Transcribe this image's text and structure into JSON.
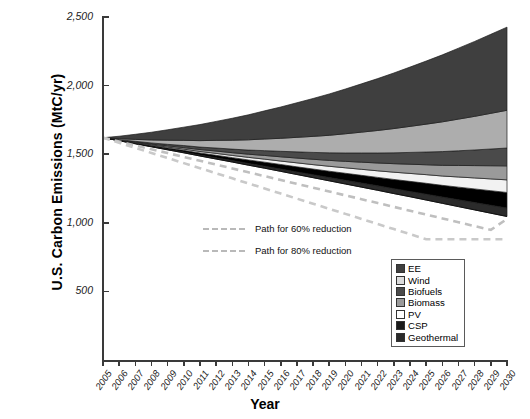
{
  "chart_data": {
    "type": "area",
    "title": "",
    "xlabel": "Year",
    "ylabel": "U.S. Carbon Emissions (MtC/yr)",
    "xlim": [
      2005,
      2030
    ],
    "ylim": [
      0,
      2500
    ],
    "ytick_labels": [
      "2,500",
      "2,000",
      "1,500",
      "1,000",
      "500"
    ],
    "ytick_values": [
      2500,
      2000,
      1500,
      1000,
      500
    ],
    "ytick_interval": 500,
    "grid": false,
    "legend_position": "inside-lower-right",
    "x": [
      2005,
      2006,
      2007,
      2008,
      2009,
      2010,
      2011,
      2012,
      2013,
      2014,
      2015,
      2016,
      2017,
      2018,
      2019,
      2020,
      2021,
      2022,
      2023,
      2024,
      2025,
      2026,
      2027,
      2028,
      2029,
      2030
    ],
    "baseline_name": "Reference / business-as-usual emissions",
    "baseline": [
      1620,
      1642,
      1665,
      1688,
      1711,
      1734,
      1757,
      1780,
      1803,
      1826,
      1849,
      1872,
      1895,
      1918,
      1941,
      1964,
      1987,
      2010,
      2033,
      2056,
      2079,
      2102,
      2125,
      2148,
      2171,
      2194
    ],
    "net_emissions_name": "Net emissions after all wedges",
    "net_emissions": [
      1620,
      1598,
      1576,
      1554,
      1532,
      1510,
      1487,
      1465,
      1443,
      1420,
      1398,
      1375,
      1352,
      1329,
      1306,
      1283,
      1260,
      1237,
      1213,
      1190,
      1166,
      1142,
      1118,
      1094,
      1070,
      1046
    ],
    "series": [
      {
        "name": "EE",
        "color": "#3f3f3f",
        "swatch": "#3f3f3f",
        "values": [
          0,
          18,
          37,
          56,
          76,
          96,
          117,
          138,
          160,
          182,
          205,
          228,
          252,
          276,
          301,
          326,
          352,
          378,
          405,
          432,
          460,
          488,
          517,
          546,
          576,
          606
        ]
      },
      {
        "name": "Wind",
        "color": "#adadad",
        "swatch": "#dcdcdc",
        "values": [
          0,
          7,
          14,
          22,
          30,
          38,
          47,
          56,
          65,
          75,
          85,
          95,
          106,
          117,
          128,
          140,
          152,
          164,
          177,
          190,
          203,
          217,
          231,
          245,
          260,
          275
        ]
      },
      {
        "name": "Biofuels",
        "color": "#4a4a4a",
        "swatch": "#4a4a4a",
        "values": [
          0,
          2,
          5,
          8,
          11,
          15,
          18,
          22,
          26,
          30,
          35,
          40,
          45,
          50,
          55,
          61,
          67,
          73,
          79,
          86,
          93,
          100,
          107,
          114,
          122,
          130
        ]
      },
      {
        "name": "Biomass",
        "color": "#9a9a9a",
        "swatch": "#9a9a9a",
        "values": [
          0,
          2,
          4,
          6,
          9,
          11,
          14,
          17,
          20,
          23,
          27,
          31,
          35,
          39,
          43,
          47,
          52,
          57,
          62,
          67,
          72,
          78,
          84,
          90,
          96,
          102
        ]
      },
      {
        "name": "PV",
        "color": "#f2f2f2",
        "swatch": "#ffffff",
        "values": [
          0,
          1,
          3,
          5,
          7,
          9,
          11,
          14,
          16,
          19,
          22,
          25,
          29,
          32,
          36,
          40,
          44,
          48,
          53,
          58,
          63,
          68,
          74,
          80,
          86,
          92
        ]
      },
      {
        "name": "CSP",
        "color": "#000000",
        "swatch": "#1a1a1a",
        "values": [
          0,
          2,
          4,
          6,
          9,
          12,
          15,
          18,
          21,
          25,
          29,
          33,
          37,
          41,
          46,
          51,
          56,
          61,
          67,
          73,
          79,
          85,
          92,
          99,
          106,
          113
        ]
      },
      {
        "name": "Geothermal",
        "color": "#2b2b2b",
        "swatch": "#2b2b2b",
        "values": [
          0,
          1,
          2,
          3,
          4,
          6,
          7,
          9,
          11,
          13,
          15,
          17,
          19,
          22,
          24,
          27,
          30,
          33,
          36,
          39,
          43,
          46,
          50,
          54,
          58,
          62
        ]
      }
    ],
    "reference_paths": [
      {
        "name": "Path for 60% reduction",
        "style": "dashed",
        "color": "#bfbfbf",
        "values": [
          1620,
          1592,
          1564,
          1536,
          1508,
          1480,
          1452,
          1424,
          1396,
          1368,
          1340,
          1312,
          1284,
          1256,
          1228,
          1200,
          1172,
          1144,
          1116,
          1088,
          1060,
          1032,
          1004,
          976,
          948,
          1028
        ]
      },
      {
        "name": "Path for 80% reduction",
        "style": "dashed",
        "color": "#c9c9c9",
        "values": [
          1620,
          1583,
          1546,
          1509,
          1472,
          1435,
          1398,
          1361,
          1324,
          1287,
          1250,
          1213,
          1176,
          1139,
          1102,
          1065,
          1028,
          991,
          954,
          917,
          880,
          880,
          880,
          880,
          880,
          880
        ]
      }
    ],
    "annotations": [
      {
        "text": "Path for 60% reduction",
        "x": 2016,
        "y": 1000
      },
      {
        "text": "Path for 80% reduction",
        "x": 2016,
        "y": 840
      }
    ]
  },
  "axes": {
    "x_title": "Year",
    "y_title": "U.S. Carbon Emissions (MtC/yr)",
    "x_tick_labels": [
      "2005",
      "2006",
      "2007",
      "2008",
      "2009",
      "2010",
      "2011",
      "2012",
      "2013",
      "2014",
      "2015",
      "2016",
      "2017",
      "2018",
      "2019",
      "2020",
      "2021",
      "2022",
      "2023",
      "2024",
      "2025",
      "2026",
      "2027",
      "2028",
      "2029",
      "2030"
    ],
    "y_tick_labels": [
      "2,500",
      "2,000",
      "1,500",
      "1,000",
      "500"
    ]
  },
  "legend": {
    "items": [
      {
        "label": "EE"
      },
      {
        "label": "Wind"
      },
      {
        "label": "Biofuels"
      },
      {
        "label": "Biomass"
      },
      {
        "label": "PV"
      },
      {
        "label": "CSP"
      },
      {
        "label": "Geothermal"
      }
    ]
  }
}
